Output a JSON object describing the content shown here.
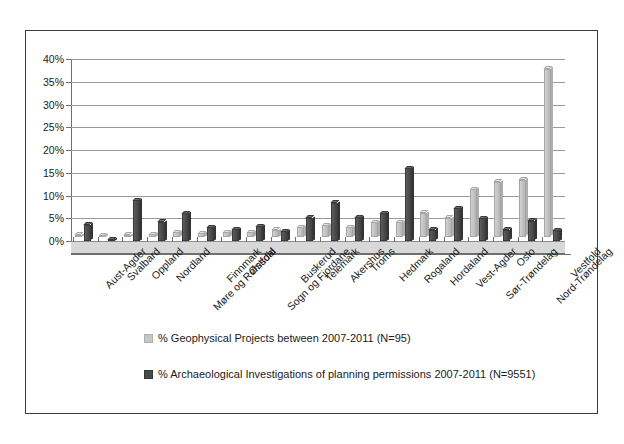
{
  "chart_data": {
    "type": "bar",
    "title": "",
    "subtitle": "",
    "xlabel": "",
    "ylabel": "",
    "ylim": [
      0,
      40
    ],
    "ytick_labels": [
      "0%",
      "5%",
      "10%",
      "15%",
      "20%",
      "25%",
      "30%",
      "35%",
      "40%"
    ],
    "ytick_values": [
      0,
      5,
      10,
      15,
      20,
      25,
      30,
      35,
      40
    ],
    "grid": true,
    "legend_position": "bottom-left",
    "style": "3d-clustered-column",
    "categories": [
      "Aust-Agder",
      "Svalbard",
      "Oppland",
      "Nordland",
      "Møre og Romsdal",
      "Finnmark",
      "Østfold",
      "Sogn og Fjordane",
      "Buskerud",
      "Telemark",
      "Akershus",
      "Troms",
      "Hedmark",
      "Rogaland",
      "Hordaland",
      "Vest-Agder",
      "Sør-Trøndelag",
      "Oslo",
      "Nord-Trøndelag",
      "Vestfold"
    ],
    "series": [
      {
        "name": "% Geophysical Projects between 2007-2011 (N=95)",
        "color": "#c6c6c6",
        "values": [
          0.5,
          0.4,
          0.5,
          0.6,
          1.1,
          0.8,
          1.1,
          1.1,
          1.6,
          2.1,
          2.6,
          2.1,
          3.2,
          3.2,
          5.3,
          4.2,
          10.5,
          12.1,
          12.6,
          37.0
        ]
      },
      {
        "name": "% Archaeological Investigations of planning permissions 2007-2011 (N=9551)",
        "color": "#4a4a4a",
        "values": [
          3.6,
          0.4,
          9.0,
          4.2,
          6.1,
          3.0,
          2.6,
          3.2,
          2.2,
          5.1,
          8.4,
          5.2,
          6.1,
          16.0,
          2.5,
          7.2,
          5.0,
          2.5,
          4.5,
          2.4
        ]
      }
    ],
    "legend": [
      {
        "swatch": "light",
        "label": "% Geophysical Projects between 2007-2011 (N=95)"
      },
      {
        "swatch": "dark",
        "label": "% Archaeological Investigations of planning permissions 2007-2011 (N=9551)"
      }
    ]
  }
}
